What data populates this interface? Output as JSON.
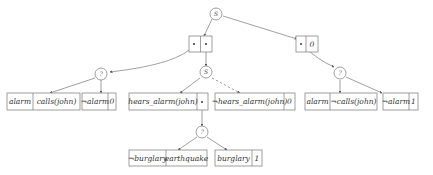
{
  "diagram": {
    "type": "decision-tree",
    "nodes": {
      "root": {
        "label": "S"
      },
      "left_choice": {
        "label": "?"
      },
      "mid_choice": {
        "label": "S"
      },
      "right_choice": {
        "label": "?"
      },
      "low_choice": {
        "label": "?"
      }
    },
    "pairs": {
      "top_left": {
        "cells": [
          "•",
          "•"
        ]
      },
      "top_right": {
        "cells": [
          "•",
          "0"
        ]
      }
    },
    "leaves": [
      {
        "id": "alarm_calls",
        "cells": [
          "alarm",
          "calls(john)"
        ]
      },
      {
        "id": "not_alarm_0",
        "cells": [
          "¬alarm",
          "0"
        ]
      },
      {
        "id": "hears_alarm",
        "cells": [
          "hears_alarm(john)",
          "•"
        ]
      },
      {
        "id": "not_hears_alarm",
        "cells": [
          "¬hears_alarm(john)",
          "0"
        ]
      },
      {
        "id": "alarm_not_calls",
        "cells": [
          "alarm",
          "¬calls(john)"
        ]
      },
      {
        "id": "not_alarm_1",
        "cells": [
          "¬alarm",
          "1"
        ]
      },
      {
        "id": "not_burglary_eq",
        "cells": [
          "¬burglary",
          "earthquake"
        ]
      },
      {
        "id": "burglary_1",
        "cells": [
          "burglary",
          "1"
        ]
      }
    ]
  }
}
